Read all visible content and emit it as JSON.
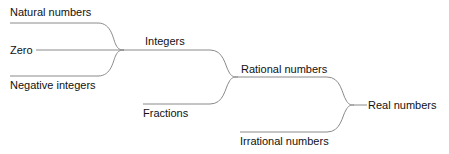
{
  "diagram": {
    "line_color": "#8a8a8a",
    "text_color": "#111111",
    "nodes": {
      "natural": "Natural numbers",
      "zero": "Zero",
      "negative": "Negative integers",
      "integers": "Integers",
      "fractions": "Fractions",
      "rational": "Rational numbers",
      "irrational": "Irrational numbers",
      "real": "Real numbers"
    },
    "edges": [
      {
        "from": "Natural numbers",
        "to": "Integers"
      },
      {
        "from": "Zero",
        "to": "Integers"
      },
      {
        "from": "Negative integers",
        "to": "Integers"
      },
      {
        "from": "Integers",
        "to": "Rational numbers"
      },
      {
        "from": "Fractions",
        "to": "Rational numbers"
      },
      {
        "from": "Rational numbers",
        "to": "Real numbers"
      },
      {
        "from": "Irrational numbers",
        "to": "Real numbers"
      }
    ]
  }
}
